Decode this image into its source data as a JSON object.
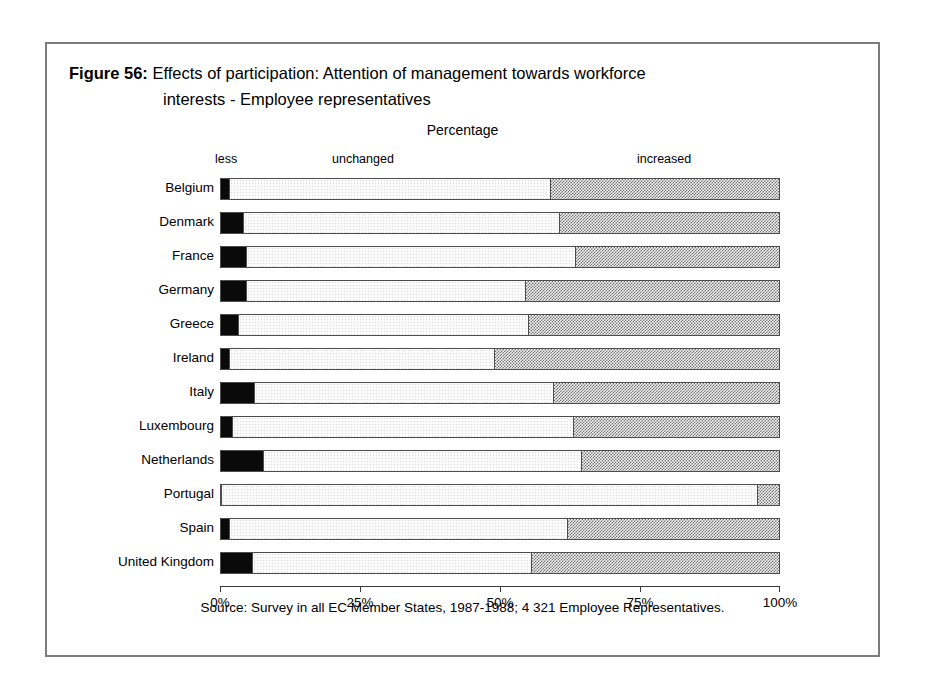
{
  "figure": {
    "label": "Figure 56:",
    "title_line_1": "Effects of participation: Attention of management towards workforce",
    "title_line_2": "interests - Employee representatives",
    "axis_caption": "Percentage",
    "source": "Source: Survey in all EC Member States, 1987-1988; 4 321 Employee Representatives."
  },
  "chart_data": {
    "type": "bar",
    "orientation": "horizontal",
    "stacked": true,
    "normalized": true,
    "title": "Effects of participation: Attention of management towards workforce interests - Employee representatives",
    "subtitle": "Percentage",
    "xlabel": "Percentage",
    "ylabel": "",
    "xlim": [
      0,
      100
    ],
    "grid": false,
    "legend_position": "top",
    "tick_labels": [
      "0%",
      "25%",
      "50%",
      "75%",
      "100%"
    ],
    "tick_values": [
      0,
      25,
      50,
      75,
      100
    ],
    "segment_labels": [
      "less",
      "unchanged",
      "increased"
    ],
    "categories": [
      "Belgium",
      "Denmark",
      "France",
      "Germany",
      "Greece",
      "Ireland",
      "Italy",
      "Luxembourg",
      "Netherlands",
      "Portugal",
      "Spain",
      "United Kingdom"
    ],
    "series": [
      {
        "name": "less",
        "values": [
          1.5,
          4.0,
          4.5,
          4.5,
          3.0,
          1.5,
          6.0,
          2.0,
          7.5,
          0.0,
          1.5,
          5.5
        ]
      },
      {
        "name": "unchanged",
        "values": [
          57.5,
          56.5,
          59.0,
          50.0,
          52.0,
          47.5,
          53.5,
          61.0,
          57.0,
          96.0,
          60.5,
          50.0
        ]
      },
      {
        "name": "increased",
        "values": [
          41.0,
          39.5,
          36.5,
          45.5,
          45.0,
          51.0,
          40.5,
          37.0,
          35.5,
          4.0,
          38.0,
          44.5
        ]
      }
    ],
    "source": "Source: Survey in all EC Member States, 1987-1988; 4 321 Employee Representatives."
  }
}
